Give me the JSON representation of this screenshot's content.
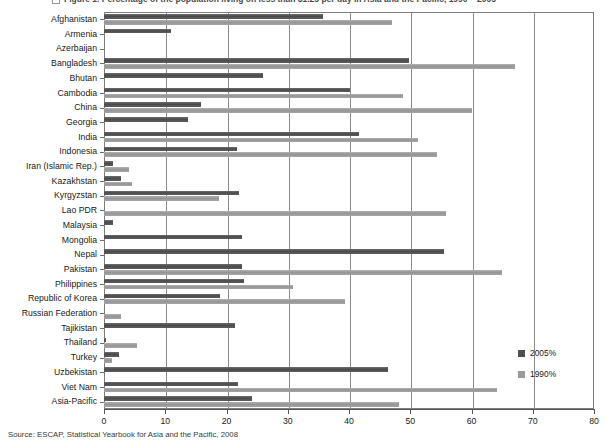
{
  "figure": {
    "title": "Figure 1.  Percentage of the population living on less than $1.25 per day in Asia and the Pacific, 1990 – 2005",
    "source": "Source: ESCAP, Statistical Yearbook for Asia and the Pacific, 2008",
    "bullet_icon": "figure-marker-icon",
    "colors": {
      "series_2005": "#4f4f4f",
      "series_1990": "#9a9a9a",
      "frame": "#7d7d7d",
      "gridline": "#8c8c8c"
    }
  },
  "chart_data": {
    "type": "bar",
    "orientation": "horizontal",
    "title": "Percentage of the population living on less than $1.25 per day in Asia and the Pacific, 1990 – 2005",
    "xlabel": "",
    "ylabel": "",
    "xlim": [
      0,
      80
    ],
    "xticks": [
      0,
      10,
      20,
      30,
      40,
      50,
      60,
      70,
      80
    ],
    "xtick_labels": [
      "0",
      "10",
      "20",
      "30",
      "40",
      "50",
      "60",
      "70",
      "80"
    ],
    "grid": true,
    "legend_position": "right",
    "categories": [
      "Afghanistan",
      "Armenia",
      "Azerbaijan",
      "Bangladesh",
      "Bhutan",
      "Cambodia",
      "China",
      "Georgia",
      "India",
      "Indonesia",
      "Iran (Islamic Rep.)",
      "Kazakhstan",
      "Kyrgyzstan",
      "Lao PDR",
      "Malaysia",
      "Mongolia",
      "Nepal",
      "Pakistan",
      "Philippines",
      "Republic of Korea",
      "Russian Federation",
      "Tajikistan",
      "Thailand",
      "Turkey",
      "Uzbekistan",
      "Viet Nam",
      "Asia-Pacific"
    ],
    "series": [
      {
        "name": "2005%",
        "color": "#4f4f4f",
        "values": [
          35.8,
          11.0,
          0.0,
          49.8,
          26.0,
          40.2,
          15.9,
          13.7,
          41.6,
          21.7,
          1.5,
          2.7,
          22.0,
          0.0,
          1.5,
          22.5,
          55.5,
          22.6,
          22.8,
          19.0,
          0.0,
          21.4,
          0.4,
          2.5,
          46.3,
          21.9,
          24.1
        ]
      },
      {
        "name": "1990%",
        "color": "#9a9a9a",
        "values": [
          47.1,
          0.0,
          0.0,
          67.1,
          0.0,
          48.8,
          60.1,
          0.0,
          51.3,
          54.4,
          4.0,
          4.5,
          18.7,
          55.8,
          0.0,
          0.0,
          0.0,
          65.0,
          30.8,
          39.3,
          2.7,
          0.0,
          5.4,
          1.3,
          0.0,
          64.2,
          48.1
        ]
      }
    ]
  },
  "legend": {
    "items": [
      {
        "label": "2005%",
        "swatch": "s2005"
      },
      {
        "label": "1990%",
        "swatch": "s1990"
      }
    ]
  }
}
